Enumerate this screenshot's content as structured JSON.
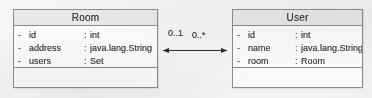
{
  "diagram": {
    "type": "uml-class-diagram",
    "background_color": "#f4f4f3",
    "classes": [
      {
        "id": "room",
        "name": "Room",
        "attributes": [
          {
            "visibility": "-",
            "name": "id",
            "separator": ":",
            "type": "int"
          },
          {
            "visibility": "-",
            "name": "address",
            "separator": ":",
            "type": "java.lang.String"
          },
          {
            "visibility": "-",
            "name": "users",
            "separator": ":",
            "type": "Set"
          }
        ],
        "operations": []
      },
      {
        "id": "user",
        "name": "User",
        "attributes": [
          {
            "visibility": "-",
            "name": "id",
            "separator": ":",
            "type": "int"
          },
          {
            "visibility": "-",
            "name": "name",
            "separator": ":",
            "type": "java.lang.String"
          },
          {
            "visibility": "-",
            "name": "room",
            "separator": ":",
            "type": "Room"
          }
        ],
        "operations": []
      }
    ],
    "association": {
      "kind": "bidirectional-association",
      "source": "Room",
      "target": "User",
      "source_multiplicity": "0..1",
      "target_multiplicity": "0..*",
      "line_color": "#2b2b2b"
    }
  }
}
